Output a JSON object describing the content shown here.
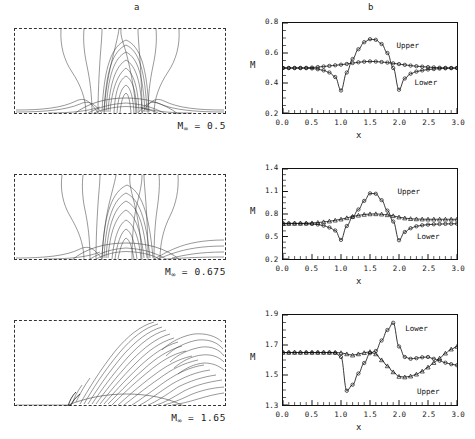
{
  "figure": {
    "column_headers": {
      "a": "a",
      "b": "b"
    }
  },
  "rows": [
    {
      "minf_prefix": "M",
      "minf_sub": "∞",
      "minf_value": " = 0.5",
      "contour_name": "mach-contours-subsonic"
    },
    {
      "minf_prefix": "M",
      "minf_sub": "∞",
      "minf_value": " = 0.675",
      "contour_name": "mach-contours-transonic"
    },
    {
      "minf_prefix": "M",
      "minf_sub": "∞",
      "minf_value": " = 1.65",
      "contour_name": "mach-contours-supersonic"
    }
  ],
  "chart_data": [
    {
      "type": "line",
      "title": "b",
      "xlabel": "x",
      "ylabel": "M",
      "xlim": [
        0.0,
        3.0
      ],
      "ylim": [
        0.2,
        0.8
      ],
      "xticks": [
        "0.0",
        "0.5",
        "1.0",
        "1.5",
        "2.0",
        "2.5",
        "3.0"
      ],
      "yticks": [
        "0.2",
        "0.4",
        "0.6",
        "0.8"
      ],
      "grid": false,
      "annotations": [
        {
          "text": "Upper",
          "x": 1.95,
          "y": 0.645
        },
        {
          "text": "Lower",
          "x": 2.26,
          "y": 0.405
        }
      ],
      "series": [
        {
          "name": "Upper",
          "marker": "circle",
          "x": [
            0.0,
            0.1,
            0.2,
            0.3,
            0.4,
            0.5,
            0.6,
            0.7,
            0.8,
            0.9,
            1.0,
            1.1,
            1.2,
            1.3,
            1.4,
            1.5,
            1.6,
            1.7,
            1.8,
            1.9,
            2.0,
            2.1,
            2.2,
            2.3,
            2.4,
            2.5,
            2.6,
            2.7,
            2.8,
            2.9,
            3.0
          ],
          "y": [
            0.5,
            0.5,
            0.5,
            0.5,
            0.499,
            0.497,
            0.492,
            0.484,
            0.47,
            0.44,
            0.35,
            0.47,
            0.56,
            0.625,
            0.672,
            0.692,
            0.688,
            0.66,
            0.6,
            0.5,
            0.355,
            0.43,
            0.462,
            0.476,
            0.484,
            0.49,
            0.493,
            0.496,
            0.498,
            0.499,
            0.5
          ]
        },
        {
          "name": "Lower",
          "marker": "circle",
          "x": [
            0.0,
            0.1,
            0.2,
            0.3,
            0.4,
            0.5,
            0.6,
            0.7,
            0.8,
            0.9,
            1.0,
            1.1,
            1.2,
            1.3,
            1.4,
            1.5,
            1.6,
            1.7,
            1.8,
            1.9,
            2.0,
            2.1,
            2.2,
            2.3,
            2.4,
            2.5,
            2.6,
            2.7,
            2.8,
            2.9,
            3.0
          ],
          "y": [
            0.5,
            0.5,
            0.5,
            0.5,
            0.501,
            0.503,
            0.506,
            0.51,
            0.514,
            0.518,
            0.522,
            0.527,
            0.533,
            0.538,
            0.542,
            0.544,
            0.543,
            0.54,
            0.536,
            0.531,
            0.526,
            0.521,
            0.516,
            0.512,
            0.509,
            0.506,
            0.504,
            0.502,
            0.501,
            0.5,
            0.5
          ]
        }
      ]
    },
    {
      "type": "line",
      "title": "b",
      "xlabel": "x",
      "ylabel": "M",
      "xlim": [
        0.0,
        3.0
      ],
      "ylim": [
        0.2,
        1.4
      ],
      "xticks": [
        "0.0",
        "0.5",
        "1.0",
        "1.5",
        "2.0",
        "2.5",
        "3.0"
      ],
      "yticks": [
        "0.2",
        "0.5",
        "0.8",
        "1.1",
        "1.4"
      ],
      "grid": false,
      "annotations": [
        {
          "text": "Upper",
          "x": 1.97,
          "y": 1.09
        },
        {
          "text": "Lower",
          "x": 2.3,
          "y": 0.5
        }
      ],
      "series": [
        {
          "name": "Upper",
          "marker": "circle",
          "x": [
            0.0,
            0.1,
            0.2,
            0.3,
            0.4,
            0.5,
            0.6,
            0.7,
            0.8,
            0.9,
            1.0,
            1.1,
            1.2,
            1.3,
            1.4,
            1.5,
            1.6,
            1.7,
            1.8,
            1.9,
            2.0,
            2.1,
            2.2,
            2.3,
            2.4,
            2.5,
            2.6,
            2.7,
            2.8,
            2.9,
            3.0
          ],
          "y": [
            0.675,
            0.675,
            0.675,
            0.674,
            0.672,
            0.668,
            0.66,
            0.645,
            0.62,
            0.58,
            0.455,
            0.64,
            0.76,
            0.86,
            0.975,
            1.075,
            1.07,
            0.985,
            0.845,
            0.7,
            0.45,
            0.56,
            0.61,
            0.636,
            0.65,
            0.658,
            0.663,
            0.666,
            0.668,
            0.669,
            0.67
          ]
        },
        {
          "name": "Lower",
          "marker": "triangle",
          "x": [
            0.0,
            0.1,
            0.2,
            0.3,
            0.4,
            0.5,
            0.6,
            0.7,
            0.8,
            0.9,
            1.0,
            1.1,
            1.2,
            1.3,
            1.4,
            1.5,
            1.6,
            1.7,
            1.8,
            1.9,
            2.0,
            2.1,
            2.2,
            2.3,
            2.4,
            2.5,
            2.6,
            2.7,
            2.8,
            2.9,
            3.0
          ],
          "y": [
            0.672,
            0.672,
            0.673,
            0.674,
            0.676,
            0.68,
            0.686,
            0.694,
            0.704,
            0.716,
            0.73,
            0.748,
            0.766,
            0.782,
            0.793,
            0.8,
            0.801,
            0.797,
            0.788,
            0.775,
            0.758,
            0.745,
            0.737,
            0.733,
            0.731,
            0.73,
            0.73,
            0.73,
            0.73,
            0.73,
            0.73
          ]
        }
      ]
    },
    {
      "type": "line",
      "title": "b",
      "xlabel": "x",
      "ylabel": "M",
      "xlim": [
        0.0,
        3.0
      ],
      "ylim": [
        1.3,
        1.9
      ],
      "xticks": [
        "0.0",
        "0.5",
        "1.0",
        "1.5",
        "2.0",
        "2.5",
        "3.0"
      ],
      "yticks": [
        "1.3",
        "1.5",
        "1.7",
        "1.9"
      ],
      "grid": false,
      "annotations": [
        {
          "text": "Lower",
          "x": 2.1,
          "y": 1.8
        },
        {
          "text": "Upper",
          "x": 2.3,
          "y": 1.392
        }
      ],
      "series": [
        {
          "name": "Lower",
          "marker": "circle",
          "x": [
            0.0,
            0.1,
            0.2,
            0.3,
            0.4,
            0.5,
            0.6,
            0.7,
            0.8,
            0.9,
            1.0,
            1.1,
            1.2,
            1.3,
            1.4,
            1.5,
            1.6,
            1.7,
            1.8,
            1.9,
            2.0,
            2.1,
            2.2,
            2.3,
            2.4,
            2.5,
            2.6,
            2.7,
            2.8,
            2.9,
            3.0
          ],
          "y": [
            1.65,
            1.65,
            1.65,
            1.65,
            1.65,
            1.65,
            1.65,
            1.65,
            1.65,
            1.648,
            1.62,
            1.395,
            1.435,
            1.51,
            1.58,
            1.645,
            1.66,
            1.73,
            1.8,
            1.848,
            1.69,
            1.62,
            1.608,
            1.612,
            1.618,
            1.62,
            1.608,
            1.595,
            1.582,
            1.572,
            1.565
          ]
        },
        {
          "name": "Upper",
          "marker": "triangle",
          "x": [
            0.0,
            0.1,
            0.2,
            0.3,
            0.4,
            0.5,
            0.6,
            0.7,
            0.8,
            0.9,
            1.0,
            1.1,
            1.2,
            1.3,
            1.4,
            1.5,
            1.6,
            1.7,
            1.8,
            1.9,
            2.0,
            2.1,
            2.2,
            2.3,
            2.4,
            2.5,
            2.6,
            2.7,
            2.8,
            2.9,
            3.0
          ],
          "y": [
            1.65,
            1.65,
            1.65,
            1.65,
            1.65,
            1.65,
            1.65,
            1.65,
            1.65,
            1.65,
            1.648,
            1.64,
            1.632,
            1.64,
            1.648,
            1.655,
            1.64,
            1.6,
            1.56,
            1.52,
            1.49,
            1.486,
            1.492,
            1.505,
            1.525,
            1.552,
            1.582,
            1.612,
            1.645,
            1.672,
            1.69
          ]
        }
      ]
    }
  ]
}
